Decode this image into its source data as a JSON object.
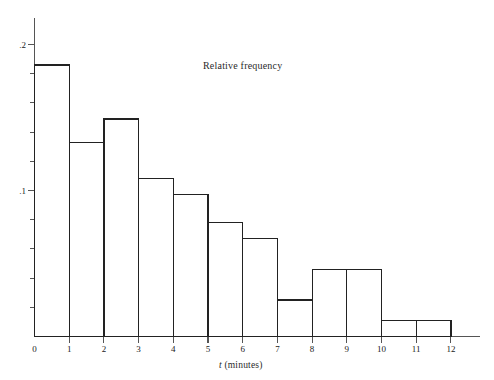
{
  "chart_data": {
    "type": "bar",
    "title": "Relative frequency",
    "xlabel": "t (minutes)",
    "ylabel": "",
    "categories": [
      "0-1",
      "1-2",
      "2-3",
      "3-4",
      "4-5",
      "5-6",
      "6-7",
      "7-8",
      "8-9",
      "9-10",
      "10-11",
      "11-12"
    ],
    "bin_edges": [
      0,
      1,
      2,
      3,
      4,
      5,
      6,
      7,
      8,
      9,
      10,
      11,
      12
    ],
    "values": [
      0.186,
      0.133,
      0.149,
      0.108,
      0.097,
      0.078,
      0.067,
      0.025,
      0.046,
      0.046,
      0.011,
      0.011
    ],
    "x": [
      0,
      1,
      2,
      3,
      4,
      5,
      6,
      7,
      8,
      9,
      10,
      11,
      12
    ],
    "xlim": [
      0,
      12
    ],
    "ylim": [
      0,
      0.21
    ],
    "xticks": [
      "0",
      "1",
      "2",
      "3",
      "4",
      "5",
      "6",
      "7",
      "8",
      "9",
      "10",
      "11",
      "12"
    ],
    "yticks_major": [
      {
        "value": 0.1,
        "label": ".1"
      },
      {
        "value": 0.2,
        "label": ".2"
      }
    ],
    "yticks_minor": [
      0.02,
      0.04,
      0.06,
      0.08,
      0.12,
      0.14,
      0.16,
      0.18
    ],
    "origin_label": "0",
    "grid": false,
    "legend": "none",
    "bar_fill": "#ffffff",
    "bar_stroke": "#222222",
    "axis_color": "#555555"
  },
  "axis_titles": {
    "y_title": "Relative frequency",
    "x_title_var": "t",
    "x_title_unit": "(minutes)"
  }
}
